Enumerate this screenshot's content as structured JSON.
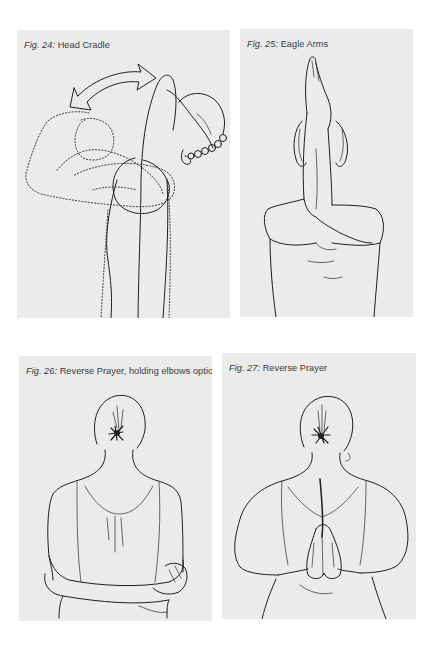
{
  "figures": [
    {
      "number": "Fig. 24:",
      "title": "Head Cradle"
    },
    {
      "number": "Fig. 25:",
      "title": "Eagle Arms"
    },
    {
      "number": "Fig. 26:",
      "title": "Reverse Prayer, holding elbows option"
    },
    {
      "number": "Fig. 27:",
      "title": "Reverse Prayer"
    }
  ],
  "colors": {
    "page_background": "#ffffff",
    "panel_background": "#ebebeb",
    "caption_text": "#3a3a3a",
    "line_art": "#1e1e1e"
  },
  "icons": {
    "fig24_arrow": "double-headed-curved-arrow"
  }
}
